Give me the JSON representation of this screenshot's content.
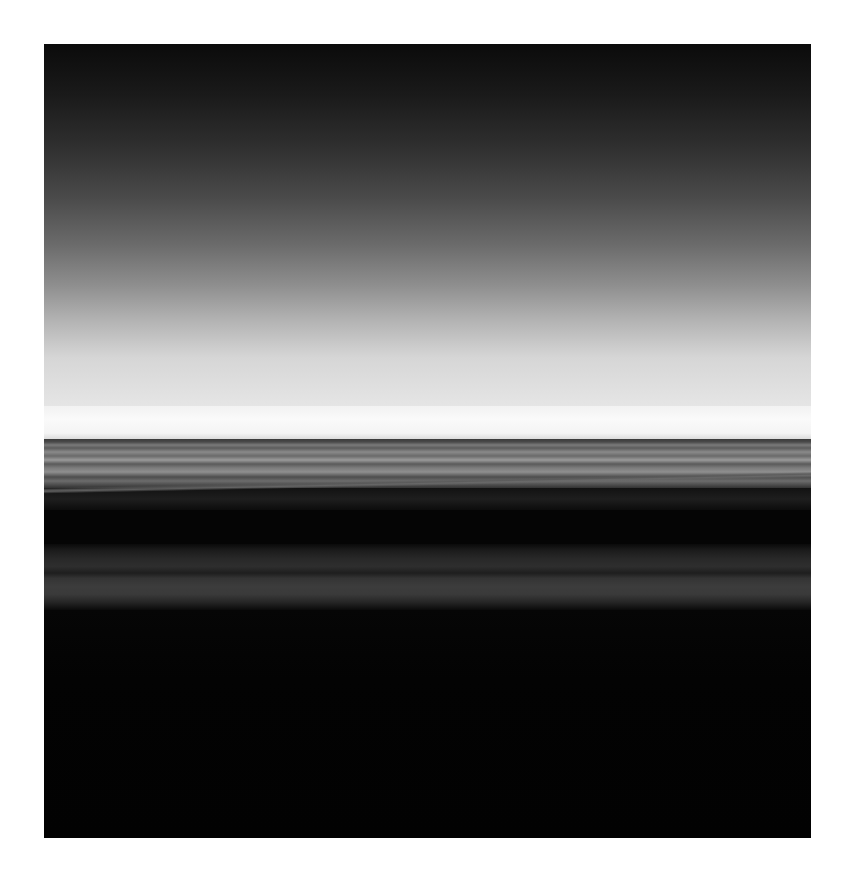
{
  "image": {
    "subject": "Long-exposure monochrome seascape with blurred horizon",
    "style": "black-and-white abstract photograph",
    "border_color": "#ffffff",
    "regions": [
      {
        "name": "sky",
        "description": "gradient from near-black at top to pale gray at horizon",
        "colors": [
          "#0b0b0b",
          "#6b6b6b",
          "#e6e6e6"
        ]
      },
      {
        "name": "horizon-glow",
        "description": "bright white band at horizon",
        "colors": [
          "#fafafa"
        ]
      },
      {
        "name": "sea-bands",
        "description": "horizontal gray streaks of blurred water",
        "colors": [
          "#3a3a3a",
          "#9a9a9a"
        ]
      },
      {
        "name": "dark-band",
        "description": "dark band with slight diagonal light streak",
        "colors": [
          "#121212",
          "#6a6a6a"
        ]
      },
      {
        "name": "lower-bands",
        "description": "muted dark gray streaks",
        "colors": [
          "#1c1c1c",
          "#3c3c3c"
        ]
      },
      {
        "name": "foreground",
        "description": "deep black lower area",
        "colors": [
          "#030303"
        ]
      }
    ]
  }
}
